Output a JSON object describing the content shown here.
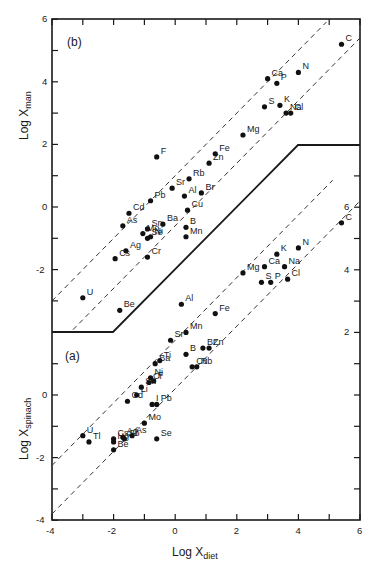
{
  "chart_data": [
    {
      "panel": "(b)",
      "type": "scatter",
      "title": "",
      "xlabel": "Log X_diet",
      "ylabel": "Log X_man",
      "xlim": [
        -4,
        6
      ],
      "ylim": [
        -4,
        6
      ],
      "yticks": [
        -2,
        0,
        2,
        4,
        6
      ],
      "grid": false,
      "reference_lines": "two dashed parallel lines of slope 1",
      "points": [
        {
          "label": "C",
          "x": 5.4,
          "y": 5.2
        },
        {
          "label": "N",
          "x": 4.0,
          "y": 4.3
        },
        {
          "label": "Ca",
          "x": 3.0,
          "y": 4.1
        },
        {
          "label": "P",
          "x": 3.3,
          "y": 3.95
        },
        {
          "label": "S",
          "x": 2.9,
          "y": 3.2
        },
        {
          "label": "K",
          "x": 3.4,
          "y": 3.25
        },
        {
          "label": "Na",
          "x": 3.6,
          "y": 3.0
        },
        {
          "label": "Cl",
          "x": 3.75,
          "y": 3.0
        },
        {
          "label": "Mg",
          "x": 2.2,
          "y": 2.3
        },
        {
          "label": "F",
          "x": -0.6,
          "y": 1.6
        },
        {
          "label": "Fe",
          "x": 1.3,
          "y": 1.7
        },
        {
          "label": "Zn",
          "x": 1.1,
          "y": 1.4
        },
        {
          "label": "Sr",
          "x": -0.1,
          "y": 0.6
        },
        {
          "label": "Rb",
          "x": 0.45,
          "y": 0.9
        },
        {
          "label": "Al",
          "x": 0.3,
          "y": 0.35
        },
        {
          "label": "Br",
          "x": 0.85,
          "y": 0.45
        },
        {
          "label": "Pb",
          "x": -0.8,
          "y": 0.2
        },
        {
          "label": "Cd",
          "x": -1.5,
          "y": -0.2
        },
        {
          "label": "Cu",
          "x": 0.4,
          "y": -0.1
        },
        {
          "label": "As",
          "x": -1.7,
          "y": -0.6
        },
        {
          "label": "Sn",
          "x": -0.9,
          "y": -0.7
        },
        {
          "label": "Ba",
          "x": -0.4,
          "y": -0.55
        },
        {
          "label": "B",
          "x": 0.35,
          "y": -0.65
        },
        {
          "label": "Ni",
          "x": -0.8,
          "y": -0.95
        },
        {
          "label": "Mo",
          "x": -1.05,
          "y": -0.85
        },
        {
          "label": "Se",
          "x": -0.9,
          "y": -1.0
        },
        {
          "label": "Mn",
          "x": 0.35,
          "y": -0.95
        },
        {
          "label": "Ag",
          "x": -1.6,
          "y": -1.4
        },
        {
          "label": "Cs",
          "x": -1.95,
          "y": -1.65
        },
        {
          "label": "Cr",
          "x": -0.9,
          "y": -1.6
        },
        {
          "label": "U",
          "x": -3.0,
          "y": -2.9
        },
        {
          "label": "Be",
          "x": -1.8,
          "y": -3.3
        }
      ]
    },
    {
      "panel": "(a)",
      "type": "scatter",
      "title": "",
      "xlabel": "Log X_diet",
      "ylabel": "Log X_spinach",
      "xlim": [
        -4,
        6
      ],
      "ylim": [
        -4,
        6
      ],
      "yticks": [
        -4,
        -2,
        0,
        2,
        4,
        6
      ],
      "xticks": [
        -4,
        -2,
        0,
        2,
        4,
        6
      ],
      "grid": false,
      "reference_lines": "two dashed parallel lines of slope 1",
      "points": [
        {
          "label": "C",
          "x": 5.4,
          "y": 5.5
        },
        {
          "label": "N",
          "x": 4.0,
          "y": 4.7
        },
        {
          "label": "K",
          "x": 3.3,
          "y": 4.5
        },
        {
          "label": "Ca",
          "x": 2.9,
          "y": 4.1
        },
        {
          "label": "Na",
          "x": 3.55,
          "y": 4.1
        },
        {
          "label": "Mg",
          "x": 2.2,
          "y": 3.9
        },
        {
          "label": "S",
          "x": 2.8,
          "y": 3.6
        },
        {
          "label": "P",
          "x": 3.1,
          "y": 3.6
        },
        {
          "label": "Cl",
          "x": 3.65,
          "y": 3.7
        },
        {
          "label": "Al",
          "x": 0.2,
          "y": 2.9
        },
        {
          "label": "Fe",
          "x": 1.3,
          "y": 2.6
        },
        {
          "label": "Mn",
          "x": 0.35,
          "y": 2.0
        },
        {
          "label": "Sr",
          "x": -0.15,
          "y": 1.75
        },
        {
          "label": "Br",
          "x": 0.9,
          "y": 1.5
        },
        {
          "label": "Zn",
          "x": 1.1,
          "y": 1.5
        },
        {
          "label": "B",
          "x": 0.35,
          "y": 1.3
        },
        {
          "label": "Ti",
          "x": -0.5,
          "y": 1.1
        },
        {
          "label": "Ba",
          "x": -0.65,
          "y": 1.0
        },
        {
          "label": "Rb",
          "x": 0.7,
          "y": 0.9
        },
        {
          "label": "Cu",
          "x": 0.55,
          "y": 0.9
        },
        {
          "label": "Ni",
          "x": -0.8,
          "y": 0.55
        },
        {
          "label": "F",
          "x": -0.7,
          "y": 0.45
        },
        {
          "label": "Cr",
          "x": -0.85,
          "y": 0.4
        },
        {
          "label": "Sn",
          "x": -1.1,
          "y": 0.25
        },
        {
          "label": "Li",
          "x": -1.25,
          "y": 0.0
        },
        {
          "label": "Cd",
          "x": -1.55,
          "y": -0.2
        },
        {
          "label": "Pb",
          "x": -0.6,
          "y": -0.3
        },
        {
          "label": "I",
          "x": -0.75,
          "y": -0.3
        },
        {
          "label": "Mo",
          "x": -1.0,
          "y": -0.9
        },
        {
          "label": "As",
          "x": -1.4,
          "y": -1.3
        },
        {
          "label": "Cs",
          "x": -2.0,
          "y": -1.4
        },
        {
          "label": "Ag",
          "x": -1.7,
          "y": -1.35
        },
        {
          "label": "U",
          "x": -3.0,
          "y": -1.3
        },
        {
          "label": "Tl",
          "x": -2.8,
          "y": -1.5
        },
        {
          "label": "Hg",
          "x": -2.0,
          "y": -1.5
        },
        {
          "label": "Sb",
          "x": -1.65,
          "y": -1.4
        },
        {
          "label": "Se",
          "x": -0.6,
          "y": -1.4
        },
        {
          "label": "Be",
          "x": -2.0,
          "y": -1.75
        }
      ]
    }
  ],
  "labels": {
    "panel_b": "(b)",
    "panel_a": "(a)",
    "ylabel_top_main": "Log X",
    "ylabel_top_sub": "man",
    "ylabel_bottom_main": "Log X",
    "ylabel_bottom_sub": "spinach",
    "xlabel_main": "Log X",
    "xlabel_sub": "diet"
  },
  "ticks": {
    "x": [
      "-4",
      "-2",
      "0",
      "2",
      "4",
      "6"
    ],
    "y_top": [
      "6",
      "4",
      "2",
      "0",
      "-2"
    ],
    "y_bottom": [
      "0",
      "-2",
      "-4"
    ],
    "y_right": [
      "6",
      "4",
      "2"
    ]
  }
}
